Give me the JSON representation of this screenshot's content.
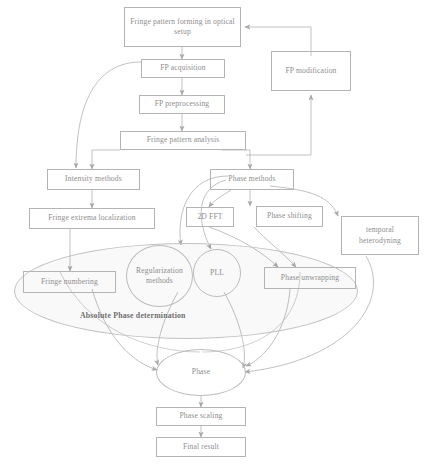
{
  "diagram": {
    "group_label": "Absolute Phase determination",
    "nodes": {
      "fringe_forming": "Fringe pattern forming in optical setup",
      "fp_acquisition": "FP acquisition",
      "fp_modification": "FP modification",
      "fp_preprocessing": "FP preprocessing",
      "fringe_analysis": "Fringe pattern analysis",
      "intensity_methods": "Intensity methods",
      "phase_methods": "Phase methods",
      "fringe_extrema": "Fringe extrema localization",
      "fft": "2D FFT",
      "phase_shifting": "Phase shifting",
      "temporal_heterodyning": "temporal heterodyning",
      "fringe_numbering": "Fringe numbering",
      "regularization": "Regularization methods",
      "pll": "PLL",
      "phase_unwrapping": "Phase  unwrapping",
      "phase": "Phase",
      "phase_scaling": "Phase scaling",
      "final_result": "Final result"
    },
    "colors": {
      "stroke": "#b4b4b4",
      "text": "#8d8d8d",
      "label_text": "#6f6f6f",
      "envelope_fill": "#f4f4f4",
      "background": "#ffffff"
    }
  }
}
